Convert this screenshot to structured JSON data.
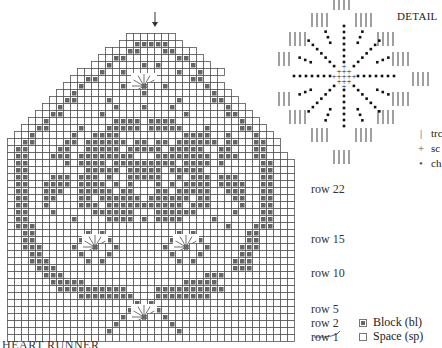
{
  "title": "HEART RUNNER",
  "detail": {
    "title": "DETAIL",
    "legend": [
      {
        "symbol": "|",
        "label": "trc",
        "icon": "treble-crochet-icon"
      },
      {
        "symbol": "+",
        "label": "sc",
        "icon": "single-crochet-icon"
      },
      {
        "symbol": "•",
        "label": "ch",
        "icon": "chain-icon"
      }
    ]
  },
  "key": [
    {
      "label": "Block (bl)",
      "type": "block"
    },
    {
      "label": "Space (sp)",
      "type": "space"
    }
  ],
  "row_labels": [
    {
      "row": 22,
      "label": "row 22"
    },
    {
      "row": 15,
      "label": "row 15"
    },
    {
      "row": 10,
      "label": "row 10"
    },
    {
      "row": 5,
      "label": "row 5"
    },
    {
      "row": 2,
      "label": "row 2"
    },
    {
      "row": 1,
      "label": "row 1"
    }
  ],
  "chart_data": {
    "type": "heatmap",
    "title": "HEART RUNNER",
    "columns": 41,
    "rows_count": 44,
    "rows_top_to_bottom": [
      "                 .......                 ",
      "                ..#####..                ",
      "              ...##...##...              ",
      "             ..##.......##..             ",
      "            ..#....#.#....#..            ",
      "          ...#..#.......#..#...          ",
      "         ..##.....#.#.....##..           ",
      "        ..#.....#..*..#.....#..          ",
      "       ..#.........#.........#..         ",
      "      ..##....#.........#....##..        ",
      "     ..#.......#...#...#.......#..       ",
      "    ..##.....#...........#.....##..      ",
      "   ..#.........####.####.........#..     ",
      "  ..##....#...#####.#####...#....##..    ",
      " ..#.....#..####.........####..#...#..   ",
      "..##....##.######.##.##.######.##..##..  ",
      ".##....##..#####.#####.#####..##...##..  ",
      ".##...###.########...########.###..##... ",
      ".##.....#.####.#########.####.#.....##...",
      ".##........#####.#####.#####........##...",
      ".##...###.###.#..#####..#.###.###...##...",
      ".##..####.####.#.#...#.#.####.####..##...",
      ".##..###..#####.##...##.#####..###..##...",
      ".##..##...##.######.######.##...##..##...",
      ".##..#....###.###########.###....#..##...",
      ".##...#.....######...######.....#...##...",
      ".##......#....####.#.####....#......##...",
      ".###...........................#...###...",
      "..##.......#.#..........#.#.......##.....",
      "..##......#...#........#...#......##.....",
      "..###....#..*..#......#..*..#....###.....",
      "...##.....#...#........#...#.....##......",
      "...###.....#.#..........#.#.....###......",
      "....###.........................###......",
      ".....###....................###..........",
      "......#####..............#####...........",
      ".......##########....##########..........",
      "..........########...########............",
      "..................#.#....................",
      ".................#...#...................",
      "................#..*..#..................",
      "...............#.......#.................",
      "..............#.........#................",
      "........................................."
    ]
  }
}
